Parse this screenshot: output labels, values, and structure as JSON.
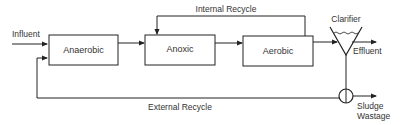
{
  "diagram": {
    "type": "process-flow",
    "nodes": [
      {
        "id": "anaerobic",
        "label": "Anaerobic"
      },
      {
        "id": "anoxic",
        "label": "Anoxic"
      },
      {
        "id": "aerobic",
        "label": "Aerobic"
      },
      {
        "id": "clarifier",
        "label": "Clarifier"
      }
    ],
    "flows": {
      "influent": "Influent",
      "internal_recycle": "Internal Recycle",
      "external_recycle": "External Recycle",
      "effluent": "Effluent",
      "sludge_wastage_line1": "Sludge",
      "sludge_wastage_line2": "Wastage"
    },
    "colors": {
      "line": "#222222",
      "text": "#333333",
      "background": "#ffffff"
    }
  }
}
